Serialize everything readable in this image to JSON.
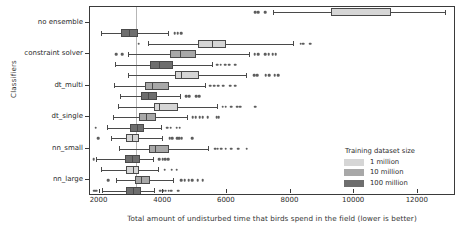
{
  "chart_data": {
    "type": "box",
    "orientation": "horizontal",
    "title": "",
    "xlabel": "Total amount of undisturbed time that birds spend in the field (lower is better)",
    "ylabel": "Classifiers",
    "xlim": [
      1700,
      13200
    ],
    "xticks": [
      2000,
      4000,
      6000,
      8000,
      10000,
      12000
    ],
    "xticklabels": [
      "2000",
      "4000",
      "6000",
      "8000",
      "10000",
      "12000"
    ],
    "categories": [
      "no ensemble",
      "constraint solver",
      "dt_multi",
      "dt_single",
      "nn_small",
      "nn_large"
    ],
    "grid": false,
    "reference_line": 3130,
    "legend": {
      "title": "Training dataset size",
      "position": "lower right",
      "entries": [
        {
          "label": "1 million",
          "color": "#d6d6d6"
        },
        {
          "label": "10 million",
          "color": "#a8a8a8"
        },
        {
          "label": "100 million",
          "color": "#6e6e6e"
        }
      ]
    },
    "series": [
      {
        "name": "1 million",
        "color": "#d6d6d6",
        "boxes": [
          {
            "category": "no ensemble",
            "whislo": 7450,
            "q1": 9270,
            "med": 9270,
            "q3": 11150,
            "whishi": 12850,
            "fliers": [
              6900,
              6990,
              7200
            ]
          },
          {
            "category": "constraint solver",
            "whislo": 3530,
            "q1": 5080,
            "med": 5520,
            "q3": 5960,
            "whishi": 8080,
            "fliers": [
              3230,
              8320,
              8390,
              8620
            ]
          },
          {
            "category": "dt_multi",
            "whislo": 2880,
            "q1": 4370,
            "med": 4560,
            "q3": 5120,
            "whishi": 6600,
            "fliers": [
              6860,
              6960,
              7220,
              7330,
              7500,
              7620
            ]
          },
          {
            "category": "dt_single",
            "whislo": 2590,
            "q1": 3700,
            "med": 3880,
            "q3": 4450,
            "whishi": 5680,
            "fliers": [
              5870,
              5960,
              6130,
              6320,
              6420,
              6890
            ]
          },
          {
            "category": "nn_small",
            "whislo": 2370,
            "q1": 2840,
            "med": 3030,
            "q3": 3250,
            "whishi": 3960,
            "fliers": [
              1960,
              4200,
              4290,
              4440,
              4500,
              4580,
              4920
            ]
          },
          {
            "category": "nn_large",
            "whislo": 2060,
            "q1": 2820,
            "med": 3060,
            "q3": 3250,
            "whishi": 3840,
            "fliers": [
              4050,
              4270,
              4420
            ]
          }
        ]
      },
      {
        "name": "10 million",
        "color": "#a8a8a8",
        "boxes": [
          {
            "category": "no ensemble",
            "whislo": null,
            "q1": null,
            "med": null,
            "q3": null,
            "whishi": null,
            "fliers": []
          },
          {
            "category": "constraint solver",
            "whislo": 2880,
            "q1": 4200,
            "med": 4520,
            "q3": 5020,
            "whishi": 6700,
            "fliers": [
              2520,
              2720,
              6880,
              6980,
              7200,
              7320,
              7440,
              7540
            ]
          },
          {
            "category": "dt_multi",
            "whislo": 2450,
            "q1": 3420,
            "med": 3640,
            "q3": 4170,
            "whishi": 5310,
            "fliers": [
              5480,
              5600,
              5720,
              5880,
              6100,
              6260
            ]
          },
          {
            "category": "dt_single",
            "whislo": 2420,
            "q1": 3250,
            "med": 3470,
            "q3": 3760,
            "whishi": 4760,
            "fliers": [
              4930,
              5020,
              5150,
              5240,
              5400,
              5680,
              5740
            ]
          },
          {
            "category": "nn_small",
            "whislo": 2610,
            "q1": 3540,
            "med": 3750,
            "q3": 4180,
            "whishi": 5420,
            "fliers": [
              5630,
              5710,
              5830,
              5960,
              6140,
              6350,
              6620
            ]
          },
          {
            "category": "nn_large",
            "whislo": 2520,
            "q1": 3100,
            "med": 3290,
            "q3": 3580,
            "whishi": 4320,
            "fliers": [
              2280,
              4570,
              4680,
              4800,
              4920,
              5080,
              5240
            ]
          }
        ]
      },
      {
        "name": "100 million",
        "color": "#6e6e6e",
        "boxes": [
          {
            "category": "no ensemble",
            "whislo": 2040,
            "q1": 2660,
            "med": 2940,
            "q3": 3200,
            "whishi": 4140,
            "fliers": [
              4360,
              4460,
              4570
            ]
          },
          {
            "category": "constraint solver",
            "whislo": 2470,
            "q1": 3600,
            "med": 3860,
            "q3": 4300,
            "whishi": 5520,
            "fliers": [
              5700,
              5810,
              5950,
              6080,
              6260
            ]
          },
          {
            "category": "dt_multi",
            "whislo": 2640,
            "q1": 3300,
            "med": 3530,
            "q3": 3820,
            "whishi": 4540,
            "fliers": [
              4720,
              4820,
              5040,
              5130
            ]
          },
          {
            "category": "dt_single",
            "whislo": 2220,
            "q1": 2960,
            "med": 3180,
            "q3": 3400,
            "whishi": 3940,
            "fliers": [
              1880,
              4130,
              4230,
              4420,
              4520
            ]
          },
          {
            "category": "nn_small",
            "whislo": 1900,
            "q1": 2810,
            "med": 3030,
            "q3": 3280,
            "whishi": 3680,
            "fliers": [
              1810,
              3880,
              3980,
              4070,
              4160
            ]
          },
          {
            "category": "nn_large",
            "whislo": 2080,
            "q1": 2840,
            "med": 3050,
            "q3": 3290,
            "whishi": 3700,
            "fliers": [
              1830,
              1900,
              3900,
              4000,
              4080,
              4170,
              4260,
              4480
            ]
          }
        ]
      }
    ]
  }
}
